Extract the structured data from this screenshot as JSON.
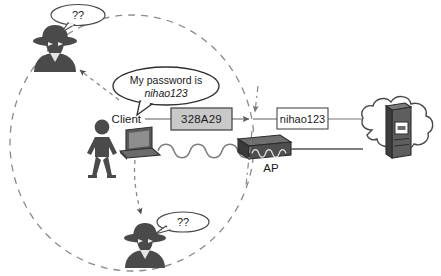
{
  "diagram": {
    "type": "network-security-diagram",
    "colors": {
      "ink": "#1a1a1a",
      "figure_fill": "#4a4a4a",
      "device_fill": "#555555",
      "cipher_box_fill": "#c9c9c9",
      "plain_box_fill": "#ffffff",
      "dashed": "#7a7a7a",
      "line": "#555555",
      "background": "#ffffff"
    }
  },
  "coverage_area": {
    "name": "wireless-coverage-ellipse",
    "style": "dashed",
    "cx": 132,
    "cy": 143,
    "rx": 122,
    "ry": 128
  },
  "actors": {
    "client": {
      "label": "Client",
      "speech": {
        "line1": "My password is",
        "line2": "nihao123"
      }
    },
    "attacker_top": {
      "label": "??"
    },
    "attacker_bottom": {
      "label": "??"
    }
  },
  "devices": {
    "laptop": {
      "name": "laptop"
    },
    "access_point": {
      "label": "AP"
    },
    "server": {
      "name": "server"
    },
    "cloud": {
      "name": "internet-cloud"
    }
  },
  "data_boxes": {
    "encrypted": {
      "value": "328A29",
      "state": "encrypted"
    },
    "plaintext": {
      "value": "nihao123",
      "state": "plaintext"
    }
  },
  "links": {
    "wireless": {
      "name": "wireless-wave-link",
      "from": "laptop",
      "to": "access_point"
    },
    "wired": {
      "name": "wired-link",
      "from": "access_point",
      "to": "cloud"
    },
    "eavesdrop_top": {
      "name": "eavesdrop-arrow-top"
    },
    "eavesdrop_bottom": {
      "name": "eavesdrop-arrow-bottom"
    },
    "decrypt_marker": {
      "name": "decryption-point-marker"
    }
  }
}
